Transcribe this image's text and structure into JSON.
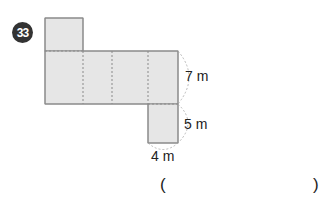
{
  "problem": {
    "number": "33",
    "figure": {
      "type": "net-of-rectangular-prism",
      "fill_color": "#e6e6e6",
      "stroke_color": "#888888",
      "dimensions": {
        "height_label": "7 m",
        "depth_label": "5 m",
        "width_label": "4 m"
      }
    },
    "answer": {
      "open_paren": "(",
      "close_paren": ")",
      "value": ""
    }
  }
}
